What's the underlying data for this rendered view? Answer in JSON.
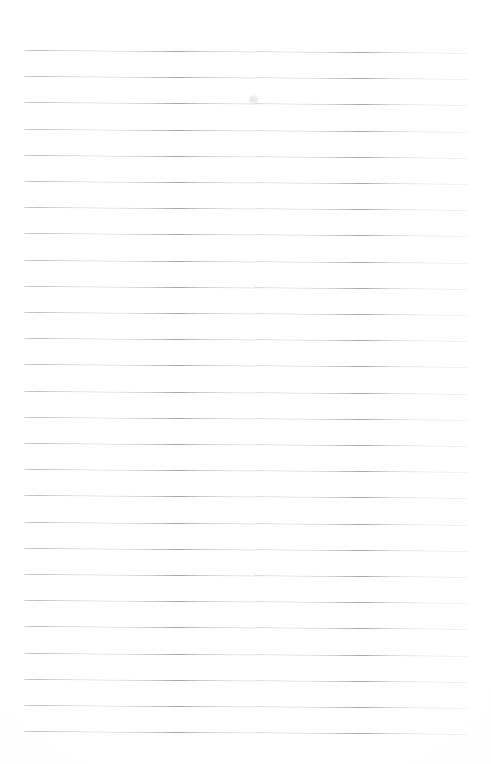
{
  "document": {
    "kind": "ruled-paper-sheet",
    "title": "Blank lined notebook page",
    "description": "A blank sheet of ruled (lined) writing paper with no written content",
    "written_text": "",
    "page_width_px": 491,
    "page_height_px": 764,
    "background_color": "#ffffff"
  },
  "ruling": {
    "line_color": "#a9a9ad",
    "line_thickness_px": 1,
    "line_count": 27,
    "first_line_y_px": 50,
    "line_spacing_px": 26.2,
    "left_margin_x_px": 24,
    "right_edge_x_px": 468,
    "line_length_px": 444,
    "tilt_degrees": 0.34,
    "lines": [
      {
        "index": 1,
        "y": 50.0,
        "label": "rule-line-1"
      },
      {
        "index": 2,
        "y": 76.2,
        "label": "rule-line-2"
      },
      {
        "index": 3,
        "y": 102.4,
        "label": "rule-line-3"
      },
      {
        "index": 4,
        "y": 128.6,
        "label": "rule-line-4"
      },
      {
        "index": 5,
        "y": 154.8,
        "label": "rule-line-5"
      },
      {
        "index": 6,
        "y": 181.0,
        "label": "rule-line-6"
      },
      {
        "index": 7,
        "y": 207.2,
        "label": "rule-line-7"
      },
      {
        "index": 8,
        "y": 233.4,
        "label": "rule-line-8"
      },
      {
        "index": 9,
        "y": 259.6,
        "label": "rule-line-9"
      },
      {
        "index": 10,
        "y": 285.8,
        "label": "rule-line-10"
      },
      {
        "index": 11,
        "y": 312.0,
        "label": "rule-line-11"
      },
      {
        "index": 12,
        "y": 338.2,
        "label": "rule-line-12"
      },
      {
        "index": 13,
        "y": 364.4,
        "label": "rule-line-13"
      },
      {
        "index": 14,
        "y": 390.6,
        "label": "rule-line-14"
      },
      {
        "index": 15,
        "y": 416.8,
        "label": "rule-line-15"
      },
      {
        "index": 16,
        "y": 443.0,
        "label": "rule-line-16"
      },
      {
        "index": 17,
        "y": 469.2,
        "label": "rule-line-17"
      },
      {
        "index": 18,
        "y": 495.4,
        "label": "rule-line-18"
      },
      {
        "index": 19,
        "y": 521.6,
        "label": "rule-line-19"
      },
      {
        "index": 20,
        "y": 547.8,
        "label": "rule-line-20"
      },
      {
        "index": 21,
        "y": 574.0,
        "label": "rule-line-21"
      },
      {
        "index": 22,
        "y": 600.2,
        "label": "rule-line-22"
      },
      {
        "index": 23,
        "y": 626.4,
        "label": "rule-line-23"
      },
      {
        "index": 24,
        "y": 652.6,
        "label": "rule-line-24"
      },
      {
        "index": 25,
        "y": 678.8,
        "label": "rule-line-25"
      },
      {
        "index": 26,
        "y": 705.0,
        "label": "rule-line-26"
      },
      {
        "index": 27,
        "y": 731.2,
        "label": "rule-line-27"
      }
    ]
  },
  "marks": [
    {
      "name": "faint-smudge",
      "x": 249,
      "y": 96,
      "opacity": 0.28
    }
  ]
}
